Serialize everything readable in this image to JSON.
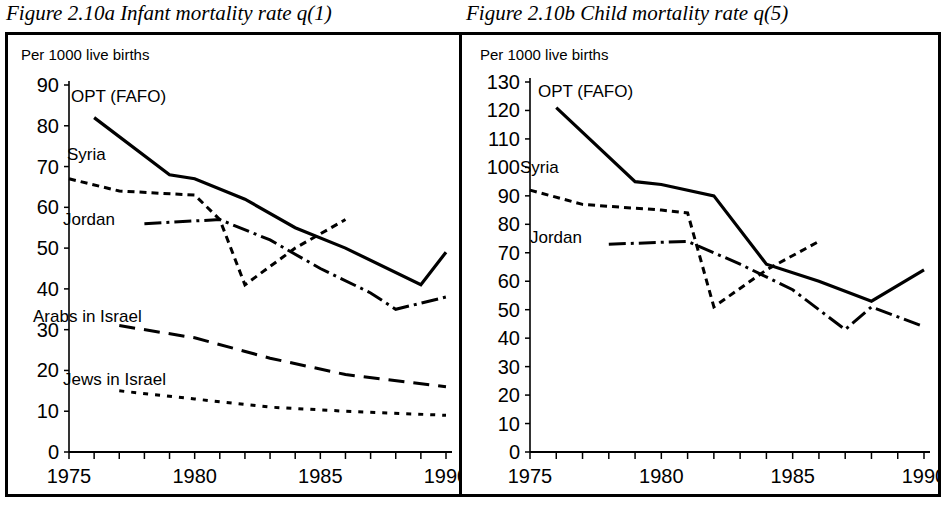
{
  "figures": {
    "a": {
      "title": "Figure 2.10a Infant mortality rate q(1)",
      "axis_note": "Per 1000 live births"
    },
    "b": {
      "title": "Figure 2.10b Child mortality rate q(5)",
      "axis_note": "Per 1000 live births"
    }
  },
  "labels": {
    "opt": "OPT (FAFO)",
    "syria": "Syria",
    "jordan": "Jordan",
    "arabs": "Arabs in Israel",
    "jews": "Jews in Israel"
  },
  "chart_data": [
    {
      "type": "line",
      "id": "figure-2-10a",
      "title": "Figure 2.10a Infant mortality rate q(1)",
      "subtitle": "Per 1000 live births",
      "xlabel": "",
      "ylabel": "Per 1000 live births",
      "xlim": [
        1975,
        1990
      ],
      "ylim": [
        0,
        90
      ],
      "yticks": [
        0,
        10,
        20,
        30,
        40,
        50,
        60,
        70,
        80,
        90
      ],
      "xticks": [
        1975,
        1980,
        1985,
        1990
      ],
      "xtick_minor_step": 1,
      "grid": false,
      "legend": "inline-annotations",
      "series": [
        {
          "name": "OPT (FAFO)",
          "style": "solid",
          "x": [
            1976,
            1979,
            1980,
            1982,
            1984,
            1986,
            1989,
            1990
          ],
          "y": [
            82,
            68,
            67,
            62,
            55,
            50,
            41,
            49
          ]
        },
        {
          "name": "Syria",
          "style": "dotted",
          "x": [
            1975,
            1977,
            1980,
            1981,
            1982,
            1984,
            1986
          ],
          "y": [
            67,
            64,
            63,
            57,
            41,
            50,
            57
          ]
        },
        {
          "name": "Jordan",
          "style": "dash-dot",
          "x": [
            1978,
            1981,
            1983,
            1985,
            1987,
            1988,
            1990
          ],
          "y": [
            56,
            57,
            52,
            45,
            39,
            35,
            38
          ]
        },
        {
          "name": "Arabs in Israel",
          "style": "long-dash",
          "x": [
            1977,
            1980,
            1983,
            1986,
            1990
          ],
          "y": [
            31,
            28,
            23,
            19,
            16
          ]
        },
        {
          "name": "Jews in Israel",
          "style": "short-dot",
          "x": [
            1977,
            1980,
            1983,
            1986,
            1990
          ],
          "y": [
            15,
            13,
            11,
            10,
            9
          ]
        }
      ]
    },
    {
      "type": "line",
      "id": "figure-2-10b",
      "title": "Figure 2.10b Child mortality rate q(5)",
      "subtitle": "Per 1000 live births",
      "xlabel": "",
      "ylabel": "Per 1000 live births",
      "xlim": [
        1975,
        1990
      ],
      "ylim": [
        0,
        130
      ],
      "yticks": [
        0,
        10,
        20,
        30,
        40,
        50,
        60,
        70,
        80,
        90,
        100,
        110,
        120,
        130
      ],
      "xticks": [
        1975,
        1980,
        1985,
        1990
      ],
      "xtick_minor_step": 1,
      "grid": false,
      "legend": "inline-annotations",
      "series": [
        {
          "name": "OPT (FAFO)",
          "style": "solid",
          "x": [
            1976,
            1979,
            1980,
            1982,
            1984,
            1986,
            1988,
            1990
          ],
          "y": [
            121,
            95,
            94,
            90,
            66,
            60,
            53,
            64
          ]
        },
        {
          "name": "Syria",
          "style": "dotted",
          "x": [
            1975,
            1977,
            1980,
            1981,
            1982,
            1984,
            1986
          ],
          "y": [
            92,
            87,
            85,
            84,
            51,
            64,
            74
          ]
        },
        {
          "name": "Jordan",
          "style": "dash-dot",
          "x": [
            1978,
            1981,
            1983,
            1985,
            1987,
            1988,
            1990
          ],
          "y": [
            73,
            74,
            66,
            57,
            43,
            51,
            44
          ]
        }
      ]
    }
  ]
}
